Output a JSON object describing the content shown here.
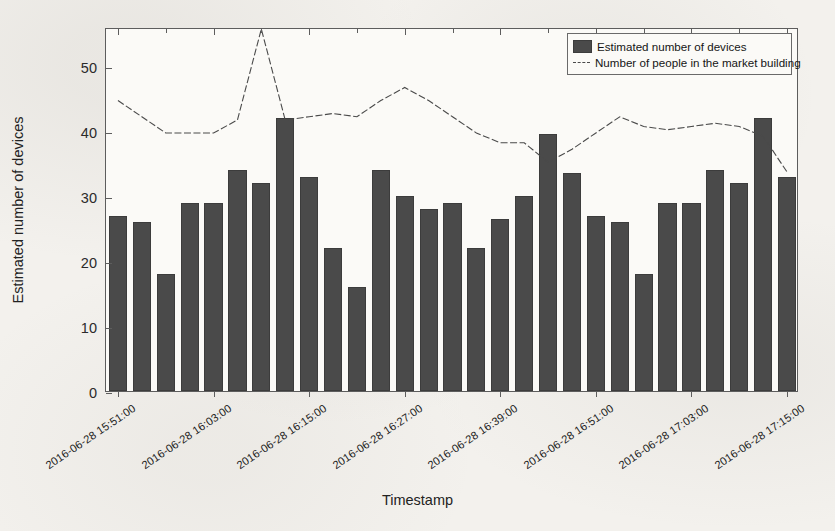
{
  "chart_data": {
    "type": "bar",
    "title": "",
    "xlabel": "Timestamp",
    "ylabel": "Estimated number of devices",
    "ylim": [
      0,
      56
    ],
    "yticks": [
      0,
      10,
      20,
      30,
      40,
      50
    ],
    "grid": false,
    "legend_position": "top-right",
    "x_tick_labels": [
      "2016-06-28 15:51:00",
      "2016-06-28 16:03:00",
      "2016-06-28 16:15:00",
      "2016-06-28 16:27:00",
      "2016-06-28 16:39:00",
      "2016-06-28 16:51:00",
      "2016-06-28 17:03:00",
      "2016-06-28 17:15:00",
      "2016-06-28 17:27:00",
      "2016-06-28 17:39:00"
    ],
    "x_tick_indices": [
      0,
      4,
      8,
      12,
      16,
      20,
      24,
      28
    ],
    "categories": [
      "2016-06-28 15:51:00",
      "2016-06-28 15:54:00",
      "2016-06-28 15:57:00",
      "2016-06-28 16:00:00",
      "2016-06-28 16:03:00",
      "2016-06-28 16:06:00",
      "2016-06-28 16:09:00",
      "2016-06-28 16:12:00",
      "2016-06-28 16:15:00",
      "2016-06-28 16:18:00",
      "2016-06-28 16:21:00",
      "2016-06-28 16:24:00",
      "2016-06-28 16:27:00",
      "2016-06-28 16:30:00",
      "2016-06-28 16:33:00",
      "2016-06-28 16:36:00",
      "2016-06-28 16:39:00",
      "2016-06-28 16:42:00",
      "2016-06-28 16:45:00",
      "2016-06-28 16:48:00",
      "2016-06-28 16:51:00",
      "2016-06-28 16:54:00",
      "2016-06-28 16:57:00",
      "2016-06-28 17:00:00",
      "2016-06-28 17:03:00",
      "2016-06-28 17:06:00",
      "2016-06-28 17:09:00",
      "2016-06-28 17:12:00",
      "2016-06-28 17:15:00"
    ],
    "series": [
      {
        "name": "Estimated number of devices",
        "type": "bar",
        "color": "#4a4a4a",
        "values": [
          27,
          26,
          18,
          29,
          29,
          34,
          32,
          42,
          33,
          22,
          16,
          34,
          30,
          28,
          29,
          22,
          26.5,
          30,
          39.5,
          33.5,
          27,
          26,
          18,
          29,
          29,
          34,
          32,
          42,
          33
        ]
      },
      {
        "name": "Number of people in the market building",
        "type": "line",
        "style": "dashed",
        "color": "#4a4a4a",
        "values": [
          45,
          42.5,
          40,
          40,
          40,
          42,
          56,
          42,
          42.5,
          43,
          42.5,
          45,
          47,
          45,
          42.5,
          40,
          38.5,
          38.5,
          35.5,
          37.5,
          40,
          42.5,
          41,
          40.5,
          41,
          41.5,
          41,
          39.5,
          34
        ]
      }
    ]
  },
  "legend": {
    "entries": [
      {
        "label": "Estimated number of devices",
        "marker": "swatch"
      },
      {
        "label": "Number of people in the market building",
        "marker": "dashed-line"
      }
    ]
  }
}
